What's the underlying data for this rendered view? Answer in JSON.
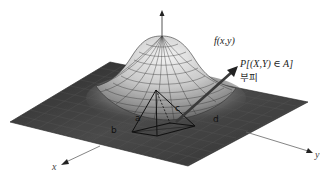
{
  "figure": {
    "colors": {
      "background": "#ffffff",
      "surface_dark": "#3a3a3a",
      "surface_mid": "#8a8a8a",
      "surface_light": "#d8d8d8",
      "grid_line": "#2a2a2a",
      "axis": "#555555",
      "text": "#222222"
    }
  },
  "labels": {
    "function": "f(x,y)",
    "probability": "P[(X,Y) ∈ A]",
    "volume": "부피",
    "x_axis": "x",
    "y_axis": "y",
    "point_a": "a",
    "point_b": "b",
    "point_c": "c",
    "point_d": "d"
  },
  "icons": {
    "z_axis_arrow": "arrow-up",
    "x_axis_arrow": "arrow-down-left",
    "y_axis_arrow": "arrow-right",
    "pointer_arrow": "arrow-up-right"
  }
}
